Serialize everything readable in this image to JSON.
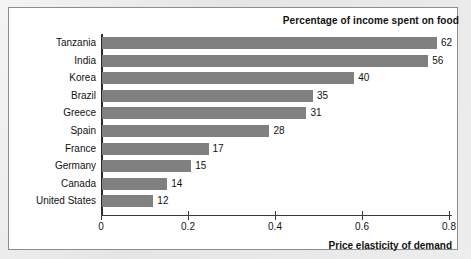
{
  "chart_data": {
    "type": "bar",
    "orientation": "horizontal",
    "title": "Percentage of income spent on food",
    "xlabel": "Price elasticity of demand",
    "ylabel": "",
    "xlim": [
      0,
      0.85
    ],
    "grid": false,
    "legend": null,
    "xticks": [
      {
        "label": "0",
        "value": 0
      },
      {
        "label": "0.2",
        "value": 0.2
      },
      {
        "label": "0.4",
        "value": 0.4
      },
      {
        "label": "0.6",
        "value": 0.6
      },
      {
        "label": "0.8",
        "value": 0.8
      }
    ],
    "categories": [
      "Tanzania",
      "India",
      "Korea",
      "Brazil",
      "Greece",
      "Spain",
      "France",
      "Germany",
      "Canada",
      "United States"
    ],
    "values": [
      0.77,
      0.75,
      0.58,
      0.485,
      0.47,
      0.385,
      0.245,
      0.205,
      0.15,
      0.118
    ],
    "data_labels": [
      "62",
      "56",
      "40",
      "35",
      "31",
      "28",
      "17",
      "15",
      "14",
      "12"
    ],
    "bar_color": "#808080",
    "series": [
      {
        "name": "Percentage of income spent on food",
        "points": [
          {
            "category": "Tanzania",
            "elasticity": 0.77,
            "percentage_of_income_spent_on_food": 62
          },
          {
            "category": "India",
            "elasticity": 0.75,
            "percentage_of_income_spent_on_food": 56
          },
          {
            "category": "Korea",
            "elasticity": 0.58,
            "percentage_of_income_spent_on_food": 40
          },
          {
            "category": "Brazil",
            "elasticity": 0.485,
            "percentage_of_income_spent_on_food": 35
          },
          {
            "category": "Greece",
            "elasticity": 0.47,
            "percentage_of_income_spent_on_food": 31
          },
          {
            "category": "Spain",
            "elasticity": 0.385,
            "percentage_of_income_spent_on_food": 28
          },
          {
            "category": "France",
            "elasticity": 0.245,
            "percentage_of_income_spent_on_food": 17
          },
          {
            "category": "Germany",
            "elasticity": 0.205,
            "percentage_of_income_spent_on_food": 15
          },
          {
            "category": "Canada",
            "elasticity": 0.15,
            "percentage_of_income_spent_on_food": 14
          },
          {
            "category": "United States",
            "elasticity": 0.118,
            "percentage_of_income_spent_on_food": 12
          }
        ]
      }
    ]
  }
}
